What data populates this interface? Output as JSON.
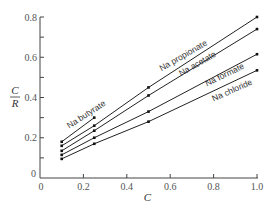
{
  "chart_data": {
    "type": "line",
    "title": "",
    "xlabel": "C",
    "ylabel": "C/R",
    "ylabel_parts": {
      "numerator": "C",
      "denominator": "R"
    },
    "xlim": [
      0,
      1.0
    ],
    "ylim": [
      0,
      0.8
    ],
    "x_ticks": [
      0,
      0.2,
      0.4,
      0.6,
      0.8,
      1.0
    ],
    "x_tick_labels": [
      "0",
      "0.2",
      "0.4",
      "0.6",
      "0.8",
      "1.0"
    ],
    "y_ticks": [
      0,
      0.2,
      0.4,
      0.6,
      0.8
    ],
    "y_tick_labels": [
      "0",
      "0.2",
      "0.4",
      "0.6",
      "0.8"
    ],
    "y_minor_ticks": [
      0.1,
      0.3,
      0.5,
      0.7
    ],
    "grid": false,
    "legend": "inline labels along lines",
    "series": [
      {
        "name": "Na butyrate",
        "x": [
          0.1,
          0.25
        ],
        "y": [
          0.18,
          0.3
        ]
      },
      {
        "name": "Na propionate",
        "x": [
          0.1,
          0.25,
          0.5,
          1.0
        ],
        "y": [
          0.16,
          0.26,
          0.45,
          0.8
        ]
      },
      {
        "name": "Na acetate",
        "x": [
          0.1,
          0.25,
          0.5,
          1.0
        ],
        "y": [
          0.135,
          0.235,
          0.41,
          0.74
        ]
      },
      {
        "name": "Na formate",
        "x": [
          0.1,
          0.25,
          0.5,
          1.0
        ],
        "y": [
          0.115,
          0.2,
          0.33,
          0.615
        ]
      },
      {
        "name": "Na chloride",
        "x": [
          0.1,
          0.25,
          0.5,
          1.0
        ],
        "y": [
          0.095,
          0.17,
          0.28,
          0.535
        ]
      }
    ]
  }
}
